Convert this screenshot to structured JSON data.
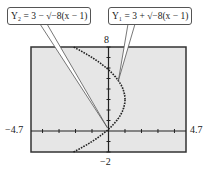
{
  "chart_data": {
    "type": "line",
    "title": "",
    "xlabel": "",
    "ylabel": "",
    "xlim": [
      -4.7,
      4.7
    ],
    "ylim": [
      -2,
      8
    ],
    "x_tick_labels": {
      "min": "−4.7",
      "max": "4.7"
    },
    "y_tick_labels": {
      "min": "−2",
      "max": "8"
    },
    "grid": false,
    "series": [
      {
        "name": "Y1 = 3 + √(−8(x − 1))",
        "function": "3 + sqrt(-8*(x-1))",
        "domain": [
          -3,
          1
        ],
        "points": [
          [
            -3.06,
            8
          ],
          [
            -2,
            7.9
          ],
          [
            -1,
            7
          ],
          [
            0,
            5.83
          ],
          [
            0.5,
            5
          ],
          [
            1,
            3
          ]
        ]
      },
      {
        "name": "Y2 = 3 − √(−8(x − 1))",
        "function": "3 - sqrt(-8*(x-1))",
        "domain": [
          -2,
          1
        ],
        "points": [
          [
            1,
            3
          ],
          [
            0.5,
            1
          ],
          [
            0,
            0.17
          ],
          [
            -1,
            -1
          ],
          [
            -2,
            -1.9
          ]
        ]
      }
    ]
  },
  "labels": {
    "y_max": "8",
    "y_min": "−2",
    "x_min": "−4.7",
    "x_max": "4.7",
    "callout_y2": "Y₂ = 3 − √−8(x − 1)",
    "callout_y1": "Y₁ = 3 + √−8(x − 1)"
  }
}
